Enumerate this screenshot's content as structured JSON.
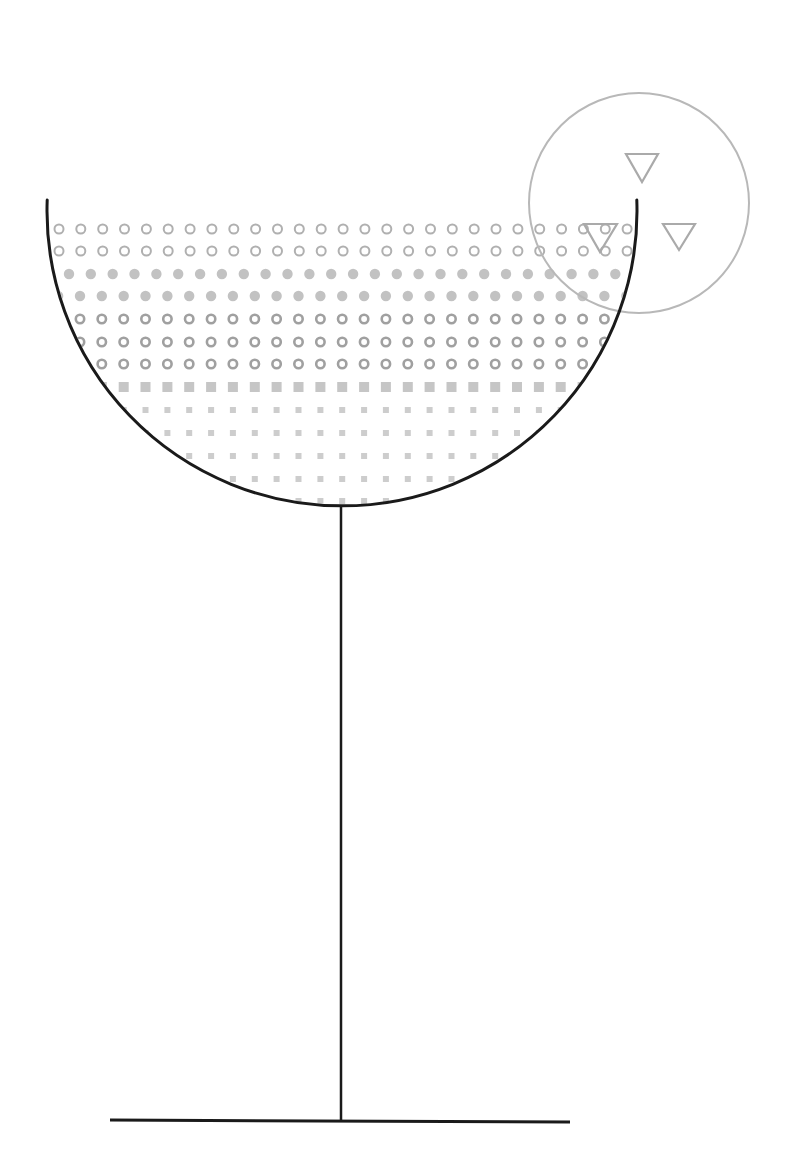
{
  "illustration": {
    "subject": "cocktail glass",
    "colors": {
      "background": "#ffffff",
      "glass_line": "#1a1a1a",
      "garnish_circle": "#b8b8b8",
      "garnish_triangle": "#aaaaaa",
      "ring_dot": "#b0b0b0",
      "ring_dot_dark": "#a0a0a0",
      "filled_dot": "#c2c2c2",
      "large_square": "#c6c6c6",
      "small_square": "#cdcdcd"
    },
    "bowl": {
      "cx": 342,
      "cy": 212,
      "r": 295,
      "rim_y": 200,
      "stroke_width": 3
    },
    "stem": {
      "x": 341,
      "y1": 507,
      "y2": 1121,
      "stroke_width": 2.5
    },
    "base": {
      "x1": 110,
      "y1": 1120,
      "x2": 570,
      "y2": 1122,
      "stroke_width": 3
    },
    "garnish": {
      "circle": {
        "cx": 639,
        "cy": 203,
        "r": 110,
        "stroke_width": 2
      },
      "triangles": [
        {
          "points": "626,154 658,154 642,182"
        },
        {
          "points": "584,224 617,224 600,252"
        },
        {
          "points": "663,224 695,224 679,250"
        }
      ]
    },
    "dot_rows": [
      {
        "y": 229,
        "shape": "ring",
        "x0": 59,
        "size": 5.5,
        "stroke": 2,
        "color_key": "ring_dot"
      },
      {
        "y": 251,
        "shape": "ring",
        "x0": 59,
        "size": 5.5,
        "stroke": 2,
        "color_key": "ring_dot"
      },
      {
        "y": 274,
        "shape": "dot",
        "x0": 69,
        "size": 5.2,
        "stroke": 0,
        "color_key": "filled_dot"
      },
      {
        "y": 296,
        "shape": "dot",
        "x0": 80,
        "size": 5.2,
        "stroke": 0,
        "color_key": "filled_dot"
      },
      {
        "y": 319,
        "shape": "ring",
        "x0": 80,
        "size": 5.5,
        "stroke": 2.6,
        "color_key": "ring_dot_dark"
      },
      {
        "y": 342,
        "shape": "ring",
        "x0": 80,
        "size": 5.5,
        "stroke": 2.6,
        "color_key": "ring_dot_dark"
      },
      {
        "y": 364,
        "shape": "ring",
        "x0": 80,
        "size": 5.5,
        "stroke": 2.6,
        "color_key": "ring_dot_dark"
      },
      {
        "y": 387,
        "shape": "square",
        "x0": 80,
        "size": 10,
        "stroke": 0,
        "color_key": "large_square"
      },
      {
        "y": 410,
        "shape": "square",
        "x0": 80,
        "size": 6,
        "stroke": 0,
        "color_key": "small_square"
      },
      {
        "y": 433,
        "shape": "square",
        "x0": 80,
        "size": 6,
        "stroke": 0,
        "color_key": "small_square"
      },
      {
        "y": 456,
        "shape": "square",
        "x0": 80,
        "size": 6,
        "stroke": 0,
        "color_key": "small_square"
      },
      {
        "y": 479,
        "shape": "square",
        "x0": 80,
        "size": 6,
        "stroke": 0,
        "color_key": "small_square"
      },
      {
        "y": 501,
        "shape": "square",
        "x0": 80,
        "size": 6,
        "stroke": 0,
        "color_key": "small_square"
      }
    ],
    "dot_spacing": 21.85,
    "dot_max_x": 640
  }
}
